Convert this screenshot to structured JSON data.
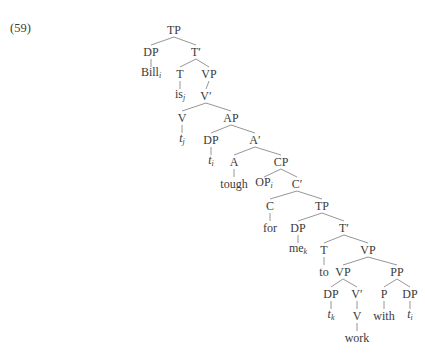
{
  "example_number": "(59)",
  "tree": {
    "nodes": [
      {
        "id": "n1",
        "label": "TP",
        "x": 174,
        "y": 30
      },
      {
        "id": "n2",
        "label": "DP",
        "x": 151,
        "y": 52
      },
      {
        "id": "n3",
        "label": "T′",
        "x": 196,
        "y": 52
      },
      {
        "id": "n4",
        "label": "Bill",
        "sub": "i",
        "x": 151,
        "y": 74
      },
      {
        "id": "n5",
        "label": "T",
        "x": 180,
        "y": 74
      },
      {
        "id": "n6",
        "label": "VP",
        "x": 209,
        "y": 74
      },
      {
        "id": "n7",
        "label": "is",
        "sub": "j",
        "x": 180,
        "y": 96
      },
      {
        "id": "n8",
        "label": "V′",
        "x": 206,
        "y": 96
      },
      {
        "id": "n9",
        "label": "V",
        "x": 182,
        "y": 118
      },
      {
        "id": "n10",
        "label": "AP",
        "x": 231,
        "y": 118
      },
      {
        "id": "n11",
        "label": "t",
        "italic": true,
        "sub": "j",
        "x": 182,
        "y": 140
      },
      {
        "id": "n12",
        "label": "DP",
        "x": 211,
        "y": 140
      },
      {
        "id": "n13",
        "label": "A′",
        "x": 255,
        "y": 140
      },
      {
        "id": "n14",
        "label": "t",
        "italic": true,
        "sub": "i",
        "x": 211,
        "y": 162
      },
      {
        "id": "n15",
        "label": "A",
        "x": 234,
        "y": 162
      },
      {
        "id": "n16",
        "label": "CP",
        "x": 281,
        "y": 162
      },
      {
        "id": "n17",
        "label": "tough",
        "x": 234,
        "y": 184
      },
      {
        "id": "n18",
        "label": "OP",
        "sub": "i",
        "x": 264,
        "y": 184
      },
      {
        "id": "n19",
        "label": "C′",
        "x": 297,
        "y": 184
      },
      {
        "id": "n20",
        "label": "C",
        "x": 270,
        "y": 206
      },
      {
        "id": "n21",
        "label": "TP",
        "x": 322,
        "y": 206
      },
      {
        "id": "n22",
        "label": "for",
        "x": 270,
        "y": 228
      },
      {
        "id": "n23",
        "label": "DP",
        "x": 298,
        "y": 228
      },
      {
        "id": "n24",
        "label": "T′",
        "x": 344,
        "y": 228
      },
      {
        "id": "n25",
        "label": "me",
        "sub": "k",
        "x": 298,
        "y": 250
      },
      {
        "id": "n26",
        "label": "T",
        "x": 324,
        "y": 250
      },
      {
        "id": "n27",
        "label": "VP",
        "x": 368,
        "y": 250
      },
      {
        "id": "n28",
        "label": "to",
        "x": 324,
        "y": 272
      },
      {
        "id": "n29",
        "label": "VP",
        "x": 343,
        "y": 272
      },
      {
        "id": "n30",
        "label": "PP",
        "x": 397,
        "y": 272
      },
      {
        "id": "n31",
        "label": "DP",
        "x": 331,
        "y": 294
      },
      {
        "id": "n32",
        "label": "V′",
        "x": 357,
        "y": 294
      },
      {
        "id": "n33",
        "label": "P",
        "x": 384,
        "y": 294
      },
      {
        "id": "n34",
        "label": "DP",
        "x": 410,
        "y": 294
      },
      {
        "id": "n35",
        "label": "t",
        "italic": true,
        "sub": "k",
        "x": 331,
        "y": 316
      },
      {
        "id": "n36",
        "label": "V",
        "x": 357,
        "y": 316
      },
      {
        "id": "n37",
        "label": "with",
        "x": 384,
        "y": 316
      },
      {
        "id": "n38",
        "label": "t",
        "italic": true,
        "sub": "i",
        "x": 410,
        "y": 316
      },
      {
        "id": "n39",
        "label": "work",
        "x": 357,
        "y": 338
      }
    ],
    "edges": [
      [
        "n1",
        "n2"
      ],
      [
        "n1",
        "n3"
      ],
      [
        "n2",
        "n4"
      ],
      [
        "n3",
        "n5"
      ],
      [
        "n3",
        "n6"
      ],
      [
        "n5",
        "n7"
      ],
      [
        "n6",
        "n8"
      ],
      [
        "n8",
        "n9"
      ],
      [
        "n8",
        "n10"
      ],
      [
        "n9",
        "n11"
      ],
      [
        "n10",
        "n12"
      ],
      [
        "n10",
        "n13"
      ],
      [
        "n12",
        "n14"
      ],
      [
        "n13",
        "n15"
      ],
      [
        "n13",
        "n16"
      ],
      [
        "n15",
        "n17"
      ],
      [
        "n16",
        "n18"
      ],
      [
        "n16",
        "n19"
      ],
      [
        "n19",
        "n20"
      ],
      [
        "n19",
        "n21"
      ],
      [
        "n20",
        "n22"
      ],
      [
        "n21",
        "n23"
      ],
      [
        "n21",
        "n24"
      ],
      [
        "n23",
        "n25"
      ],
      [
        "n24",
        "n26"
      ],
      [
        "n24",
        "n27"
      ],
      [
        "n26",
        "n28"
      ],
      [
        "n27",
        "n29"
      ],
      [
        "n27",
        "n30"
      ],
      [
        "n29",
        "n31"
      ],
      [
        "n29",
        "n32"
      ],
      [
        "n30",
        "n33"
      ],
      [
        "n30",
        "n34"
      ],
      [
        "n31",
        "n35"
      ],
      [
        "n32",
        "n36"
      ],
      [
        "n33",
        "n37"
      ],
      [
        "n34",
        "n38"
      ],
      [
        "n36",
        "n39"
      ]
    ]
  }
}
